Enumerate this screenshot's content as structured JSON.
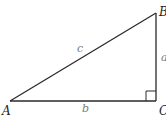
{
  "diagram": {
    "type": "right-triangle",
    "vertices": [
      {
        "id": "A",
        "label": "A",
        "x": 10,
        "y": 101
      },
      {
        "id": "B",
        "label": "B",
        "x": 156,
        "y": 13
      },
      {
        "id": "C",
        "label": "C",
        "x": 156,
        "y": 101
      }
    ],
    "sides": [
      {
        "id": "a",
        "label": "a",
        "from": "B",
        "to": "C"
      },
      {
        "id": "b",
        "label": "b",
        "from": "A",
        "to": "C"
      },
      {
        "id": "c",
        "label": "c",
        "from": "A",
        "to": "B"
      }
    ],
    "right_angle_at": "C",
    "colors": {
      "stroke": "#2a2a2a",
      "vertex_label": "#222222",
      "side_label": "#7a7a7a",
      "background": "#ffffff"
    }
  }
}
